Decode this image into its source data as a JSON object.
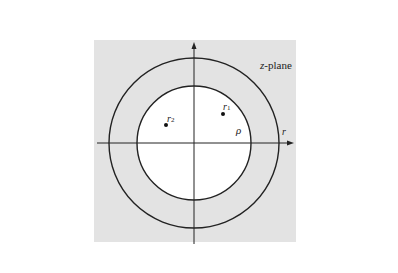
{
  "figure": {
    "plane_label_italic": "z",
    "plane_label_rest": "-plane",
    "point_labels": [
      {
        "base": "r",
        "sub": "1"
      },
      {
        "base": "r",
        "sub": "2"
      }
    ],
    "inner_radius_label": "ρ",
    "outer_radius_label": "r",
    "region_description": "Annular region of convergence between inner circle of radius ρ and outer circle of radius r (shaded gray)"
  },
  "colors": {
    "page_background": "#ffffff",
    "shaded_region": "#e3e3e3",
    "inner_disk": "#ffffff",
    "stroke": "#222222"
  }
}
